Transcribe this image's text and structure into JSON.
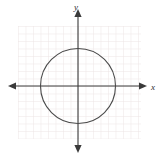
{
  "figure": {
    "name": "coordinate-plane-with-circle",
    "width": 160,
    "height": 159,
    "background_color": "#ffffff"
  },
  "axes": {
    "x_label": "x",
    "y_label": "y",
    "axis_color": "#3a3a3a",
    "origin": {
      "x": 78,
      "y": 86
    },
    "x_axis": {
      "start_x": 9,
      "end_x": 147,
      "y": 86,
      "arrows": "both"
    },
    "y_axis": {
      "x": 78,
      "start_y": 10,
      "end_y": 152,
      "arrows": "both"
    }
  },
  "grid": {
    "color": "#ece4e4",
    "cell_size": 7.5,
    "left": 18,
    "top": 26,
    "right": 141,
    "bottom": 139,
    "columns": 16,
    "rows": 15,
    "visible": true
  },
  "chart_data": {
    "type": "scatter",
    "title": "",
    "xlabel": "x",
    "ylabel": "y",
    "grid": true,
    "legend": "none",
    "xlim": [
      -8,
      9
    ],
    "ylim": [
      -7,
      8
    ],
    "shapes": [
      {
        "kind": "circle",
        "center": [
          0,
          0
        ],
        "radius_units": 5,
        "center_px": [
          78,
          86
        ],
        "radius_px": 37.5,
        "stroke": "#4a4a4a",
        "fill": "none",
        "stroke_width": 1.1,
        "equation": "x^2 + y^2 = 25"
      }
    ],
    "series": [],
    "x": [],
    "values": []
  }
}
